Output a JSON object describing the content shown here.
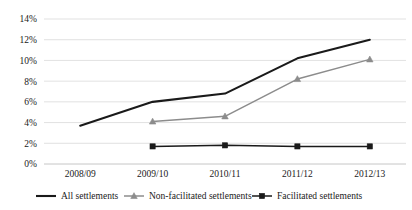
{
  "chart_data": {
    "type": "line",
    "title": "",
    "xlabel": "",
    "ylabel": "",
    "categories": [
      "2008/09",
      "2009/10",
      "2010/11",
      "2011/12",
      "2012/13"
    ],
    "ylim": [
      0,
      14
    ],
    "ytick_labels": [
      "0%",
      "2%",
      "4%",
      "6%",
      "8%",
      "10%",
      "12%",
      "14%"
    ],
    "ytick_values": [
      0,
      2,
      4,
      6,
      8,
      10,
      12,
      14
    ],
    "grid": true,
    "legend_position": "bottom",
    "series": [
      {
        "name": "All settlements",
        "color": "#1a1a1a",
        "marker": "none",
        "line_width": 2.1,
        "x": [
          "2008/09",
          "2009/10",
          "2010/11",
          "2011/12",
          "2012/13"
        ],
        "values": [
          3.7,
          6.0,
          6.8,
          10.2,
          12.0
        ]
      },
      {
        "name": "Non-facilitated settlements",
        "color": "#8c8c8c",
        "marker": "triangle",
        "line_width": 1.5,
        "x": [
          "2009/10",
          "2010/11",
          "2011/12",
          "2012/13"
        ],
        "values": [
          4.1,
          4.6,
          8.2,
          10.1
        ]
      },
      {
        "name": "Facilitated settlements",
        "color": "#1a1a1a",
        "marker": "square",
        "line_width": 1.5,
        "x": [
          "2009/10",
          "2010/11",
          "2011/12",
          "2012/13"
        ],
        "values": [
          1.7,
          1.8,
          1.7,
          1.7
        ]
      }
    ]
  },
  "legend": {
    "items": [
      {
        "label": "All settlements",
        "marker": "line"
      },
      {
        "label": "Non-facilitated settlements",
        "marker": "triangle"
      },
      {
        "label": "Facilitated settlements",
        "marker": "square"
      }
    ]
  }
}
